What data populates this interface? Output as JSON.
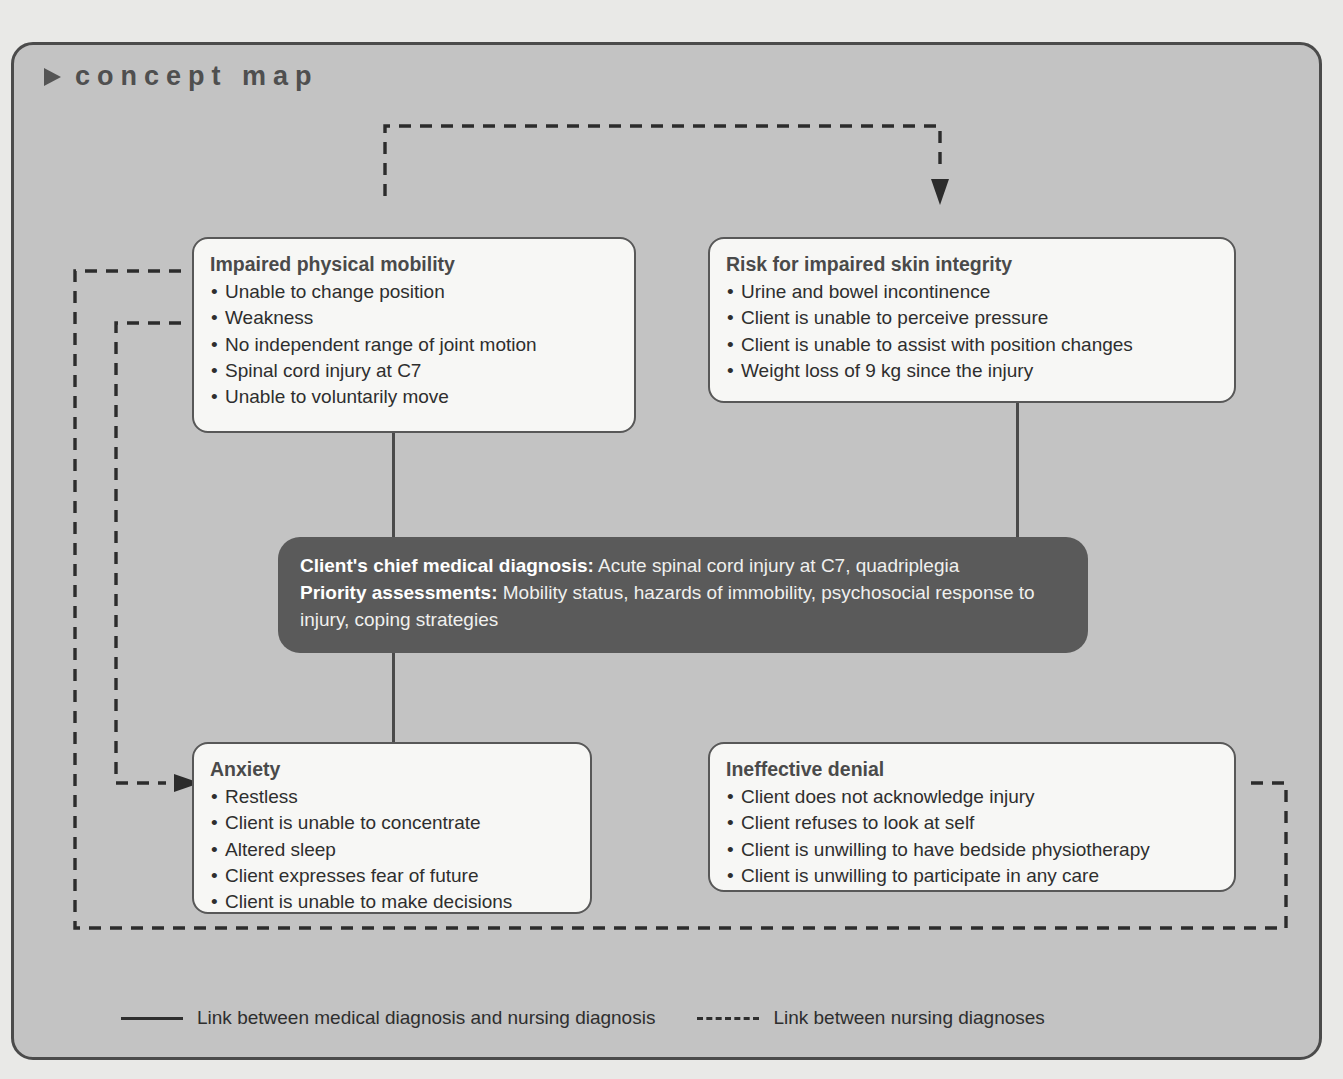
{
  "header": {
    "bullet_icon": "triangle-right-icon",
    "title": "concept map"
  },
  "boxes": {
    "mobility": {
      "title": "Impaired physical mobility",
      "items": [
        "Unable to change position",
        "Weakness",
        "No independent range of joint motion",
        "Spinal cord injury at C7",
        "Unable to voluntarily move"
      ]
    },
    "skin": {
      "title": "Risk for impaired skin integrity",
      "items": [
        "Urine and bowel incontinence",
        "Client is unable to perceive pressure",
        "Client is unable to assist with position changes",
        "Weight loss of 9 kg since the injury"
      ]
    },
    "anxiety": {
      "title": "Anxiety",
      "items": [
        "Restless",
        "Client is unable to concentrate",
        "Altered sleep",
        "Client expresses fear of future",
        "Client is unable to make decisions"
      ]
    },
    "denial": {
      "title": "Ineffective denial",
      "items": [
        "Client does not acknowledge injury",
        "Client refuses to look at self",
        "Client is unwilling to have bedside physiotherapy",
        "Client is unwilling to participate in any care"
      ]
    },
    "central": {
      "line1_label": "Client's chief medical diagnosis:",
      "line1_value": " Acute spinal cord injury at C7, quadriplegia",
      "line2_label": "Priority assessments:",
      "line2_value": " Mobility status, hazards of immobility, psychosocial response to injury, coping strategies"
    }
  },
  "legend": [
    {
      "marker": "solid-line-icon",
      "label": "Link between medical diagnosis and nursing diagnosis"
    },
    {
      "marker": "dashed-line-icon",
      "label": "Link between nursing diagnoses"
    }
  ],
  "colors": {
    "panel_background": "#c3c3c3",
    "panel_border": "#4b4b4b",
    "box_fill": "#f7f7f5",
    "box_border": "#585858",
    "central_fill": "#5a5a5a",
    "central_text": "#f0f0ee",
    "connector": "#2c2c2c",
    "page_background": "#e9e9e7"
  }
}
